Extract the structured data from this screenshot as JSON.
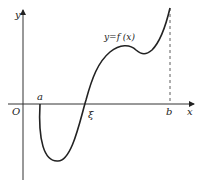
{
  "diagram": {
    "axes": {
      "x_label": "x",
      "y_label": "y",
      "origin_label": "O"
    },
    "points": {
      "a_label": "a",
      "xi_label": "ξ",
      "b_label": "b"
    },
    "curve_label": "y=f (x)",
    "colors": {
      "stroke": "#222222",
      "background": "#ffffff"
    }
  }
}
